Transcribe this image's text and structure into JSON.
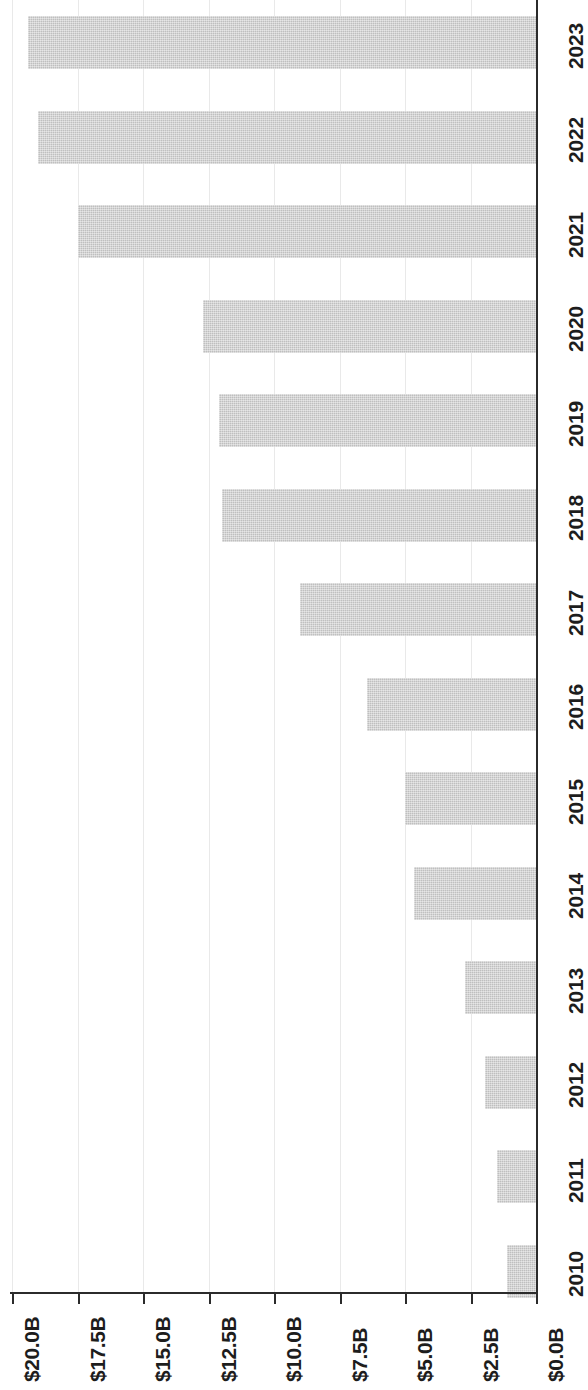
{
  "chart_data": {
    "type": "bar",
    "orientation": "horizontal-rotated",
    "title": "",
    "subtitle": "",
    "xlabel": "",
    "ylabel": "",
    "categories": [
      "2010",
      "2011",
      "2012",
      "2013",
      "2014",
      "2015",
      "2016",
      "2017",
      "2018",
      "2019",
      "2020",
      "2021",
      "2022",
      "2023"
    ],
    "values": [
      1.1,
      1.5,
      1.95,
      2.7,
      4.65,
      5.0,
      6.45,
      9.0,
      12.0,
      12.1,
      12.7,
      17.5,
      19.0,
      19.4
    ],
    "value_unit": "B",
    "value_prefix": "$",
    "value_axis_ticks": [
      0.0,
      2.5,
      5.0,
      7.5,
      10.0,
      12.5,
      15.0,
      17.5,
      20.0
    ],
    "value_axis_tick_labels": [
      "$0.0B",
      "$2.5B",
      "$5.0B",
      "$7.5B",
      "$10.0B",
      "$12.5B",
      "$15.0B",
      "$17.5B",
      "$20.0B"
    ],
    "xlim": [
      0,
      20
    ],
    "grid": true,
    "grid_axis": "value",
    "legend": null,
    "legend_position": "none",
    "bar_color": "#c9c9c9",
    "axis_color": "#2b2b2b",
    "grid_color": "#e9e9e9",
    "text_color": "#1d1d1d",
    "background": "#ffffff",
    "annotations": []
  },
  "axis": {
    "value_tick_labels": [
      {
        "text": "$20.0B",
        "value": 20.0
      },
      {
        "text": "$17.5B",
        "value": 17.5
      },
      {
        "text": "$15.0B",
        "value": 15.0
      },
      {
        "text": "$12.5B",
        "value": 12.5
      },
      {
        "text": "$10.0B",
        "value": 10.0
      },
      {
        "text": "$7.5B",
        "value": 7.5
      },
      {
        "text": "$5.0B",
        "value": 5.0
      },
      {
        "text": "$2.5B",
        "value": 2.5
      },
      {
        "text": "$0.0B",
        "value": 0.0
      }
    ],
    "category_tick_labels": [
      {
        "text": "2023"
      },
      {
        "text": "2022"
      },
      {
        "text": "2021"
      },
      {
        "text": "2020"
      },
      {
        "text": "2019"
      },
      {
        "text": "2018"
      },
      {
        "text": "2017"
      },
      {
        "text": "2016"
      },
      {
        "text": "2015"
      },
      {
        "text": "2014"
      },
      {
        "text": "2013"
      },
      {
        "text": "2012"
      },
      {
        "text": "2011"
      },
      {
        "text": "2010"
      }
    ]
  }
}
